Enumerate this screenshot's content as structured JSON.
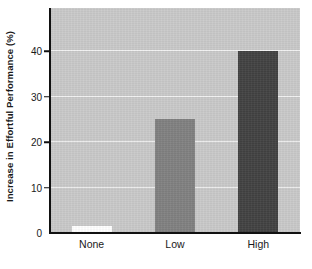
{
  "chart_data": {
    "type": "bar",
    "title": "",
    "xlabel": "",
    "ylabel": "Increase in Effortful Performance (%)",
    "categories": [
      "None",
      "Low",
      "High"
    ],
    "values": [
      1.5,
      25,
      40
    ],
    "ylim": [
      0,
      49.5
    ],
    "yticks": [
      0,
      10,
      20,
      30,
      40
    ],
    "ytick_labels": [
      "0",
      "10",
      "20",
      "30",
      "40"
    ],
    "grid": true,
    "gridline_color": "#f2f2f2",
    "legend": "none",
    "plot_background": "#c9c9c9",
    "figure_background": "#ffffff",
    "axis_color": "#111111",
    "bar_colors": [
      "#ffffff",
      "#808080",
      "#414141"
    ],
    "bars": [
      {
        "label": "None",
        "value": 1.5,
        "color": "#ffffff"
      },
      {
        "label": "Low",
        "value": 25,
        "color": "#808080"
      },
      {
        "label": "High",
        "value": 40,
        "color": "#414141"
      }
    ]
  }
}
